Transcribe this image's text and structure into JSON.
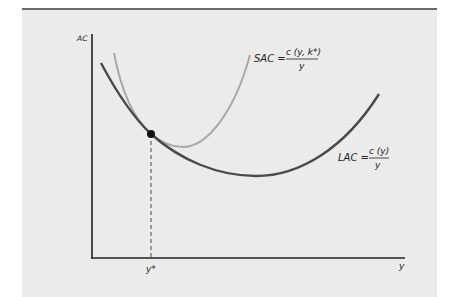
{
  "diagram": {
    "axes": {
      "y_label": "AC",
      "x_label": "y",
      "x_tick_label": "y*"
    },
    "curves": {
      "sac": {
        "name": "SAC",
        "lhs": "SAC =",
        "numerator": "c (y, k*)",
        "denominator": "y",
        "color": "#a9a9a9"
      },
      "lac": {
        "name": "LAC",
        "lhs": "LAC =",
        "numerator": "c (y)",
        "denominator": "y",
        "color": "#4a4a4a"
      }
    },
    "tangency_point": {
      "label": "y*",
      "color": "#111111"
    },
    "colors": {
      "panel_background": "#ebebeb",
      "panel_top_border": "#6a6a6a",
      "axis": "#222222"
    }
  }
}
